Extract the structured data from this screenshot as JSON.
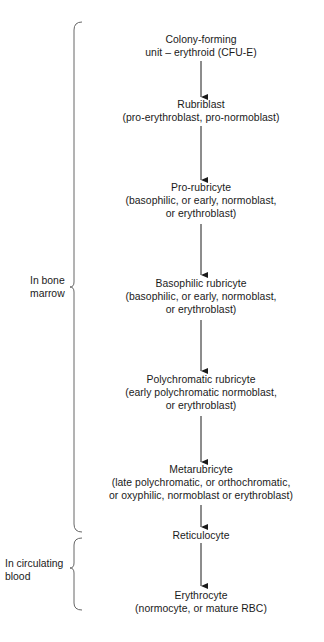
{
  "diagram": {
    "type": "flowchart",
    "direction": "top-to-bottom",
    "nodes": [
      {
        "id": "cfu-e",
        "lines": [
          "Colony-forming",
          "unit – erythroid (CFU-E)"
        ]
      },
      {
        "id": "rubriblast",
        "lines": [
          "Rubriblast",
          "(pro-erythroblast, pro-normoblast)"
        ]
      },
      {
        "id": "pro-rubricyte",
        "lines": [
          "Pro-rubricyte",
          "(basophilic, or early, normoblast,",
          "or erythroblast)"
        ]
      },
      {
        "id": "basophilic-rubricyte",
        "lines": [
          "Basophilic rubricyte",
          "(basophilic, or early, normoblast,",
          "or erythroblast)"
        ]
      },
      {
        "id": "polychromatic-rubricyte",
        "lines": [
          "Polychromatic rubricyte",
          "(early polychromatic normoblast,",
          "or erythroblast)"
        ]
      },
      {
        "id": "metarubricyte",
        "lines": [
          "Metarubricyte",
          "(late polychromatic, or orthochromatic,",
          "or oxyphilic, normoblast or erythroblast)"
        ]
      },
      {
        "id": "reticulocyte",
        "lines": [
          "Reticulocyte"
        ]
      },
      {
        "id": "erythrocyte",
        "lines": [
          "Erythrocyte",
          "(normocyte, or mature RBC)"
        ]
      }
    ],
    "edges": [
      [
        "cfu-e",
        "rubriblast"
      ],
      [
        "rubriblast",
        "pro-rubricyte"
      ],
      [
        "pro-rubricyte",
        "basophilic-rubricyte"
      ],
      [
        "basophilic-rubricyte",
        "polychromatic-rubricyte"
      ],
      [
        "polychromatic-rubricyte",
        "metarubricyte"
      ],
      [
        "metarubricyte",
        "reticulocyte"
      ],
      [
        "reticulocyte",
        "erythrocyte"
      ]
    ],
    "groups": [
      {
        "id": "bone-marrow",
        "lines": [
          "In bone",
          "marrow"
        ],
        "spans": [
          "cfu-e",
          "metarubricyte"
        ]
      },
      {
        "id": "circulating-blood",
        "lines": [
          "In circulating",
          "blood"
        ],
        "spans": [
          "reticulocyte",
          "erythrocyte"
        ]
      }
    ],
    "colors": {
      "ink": "#1a1a1a",
      "background": "#ffffff",
      "bracket": "#555555"
    },
    "caption_partial": "(caption text cut off at bottom edge — illegible)"
  }
}
